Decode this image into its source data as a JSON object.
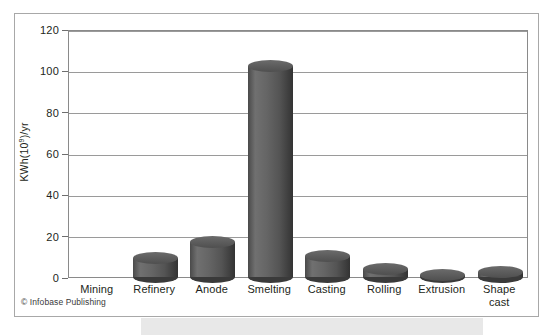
{
  "figure": {
    "credit": "© Infobase Publishing"
  },
  "chart_data": {
    "type": "bar",
    "title": "",
    "xlabel": "",
    "ylabel": "KWh(10⁹)/yr",
    "ylabel_base": "KWh(10",
    "ylabel_exp": "9",
    "ylabel_tail": ")/yr",
    "ylim": [
      0,
      120
    ],
    "ytick_values": [
      0,
      20,
      40,
      60,
      80,
      100,
      120
    ],
    "ytick_labels": [
      "0",
      "20",
      "40",
      "60",
      "80",
      "100",
      "120"
    ],
    "grid": true,
    "legend": "none",
    "style": "3d-cylinder",
    "bar_color": "#565656",
    "categories": [
      "Mining",
      "Refinery",
      "Anode",
      "Smelting",
      "Casting",
      "Rolling",
      "Extrusion",
      "Shape cast"
    ],
    "category_labels": [
      [
        "Mining"
      ],
      [
        "Refinery"
      ],
      [
        "Anode"
      ],
      [
        "Smelting"
      ],
      [
        "Casting"
      ],
      [
        "Rolling"
      ],
      [
        "Extrusion"
      ],
      [
        "Shape",
        "cast"
      ]
    ],
    "values": [
      0,
      12,
      20,
      105,
      13,
      7,
      4,
      5.5
    ]
  }
}
